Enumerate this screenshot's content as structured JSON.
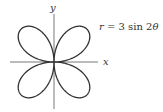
{
  "chart_data": {
    "type": "line",
    "title": "",
    "equation": "r = 3 sin 2θ",
    "xlabel": "x",
    "ylabel": "y",
    "curve": "polar rose, 4 petals",
    "r_max": 3,
    "petal_angles_deg": [
      45,
      135,
      225,
      315
    ],
    "grid": false,
    "legend": null
  },
  "labels": {
    "x_axis": "x",
    "y_axis": "y",
    "equation_r": "r",
    "equation_rest": " = 3 sin 2",
    "equation_theta": "θ"
  },
  "colors": {
    "curve": "#333333",
    "axes": "#555555",
    "background": "#ffffff"
  }
}
